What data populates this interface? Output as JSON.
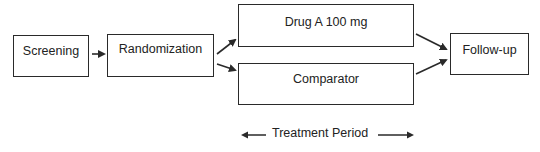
{
  "diagram": {
    "type": "clinical-trial-flow",
    "nodes": [
      {
        "id": "screening",
        "label": "Screening"
      },
      {
        "id": "randomization",
        "label": "Randomization"
      },
      {
        "id": "druga",
        "label": "Drug A 100 mg"
      },
      {
        "id": "comparator",
        "label": "Comparator"
      },
      {
        "id": "followup",
        "label": "Follow-up"
      }
    ],
    "edges": [
      {
        "from": "screening",
        "to": "randomization"
      },
      {
        "from": "randomization",
        "to": "druga"
      },
      {
        "from": "randomization",
        "to": "comparator"
      },
      {
        "from": "druga",
        "to": "followup"
      },
      {
        "from": "comparator",
        "to": "followup"
      }
    ],
    "span_label": "Treatment Period",
    "colors": {
      "stroke": "#2a2a2a",
      "background": "#ffffff",
      "text": "#222222"
    }
  }
}
